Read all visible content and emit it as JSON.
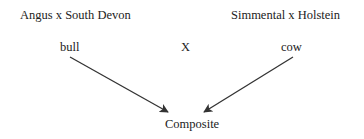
{
  "diagram": {
    "type": "breeding-cross",
    "parents": [
      {
        "breed_cross": "Angus x South Devon",
        "role": "bull"
      },
      {
        "breed_cross": "Simmental x Holstein",
        "role": "cow"
      }
    ],
    "cross_symbol": "X",
    "offspring": "Composite",
    "edges": [
      {
        "from": "bull",
        "to": "Composite"
      },
      {
        "from": "cow",
        "to": "Composite"
      }
    ],
    "colors": {
      "text": "#222222",
      "arrow": "#333333",
      "background": "#ffffff"
    }
  }
}
